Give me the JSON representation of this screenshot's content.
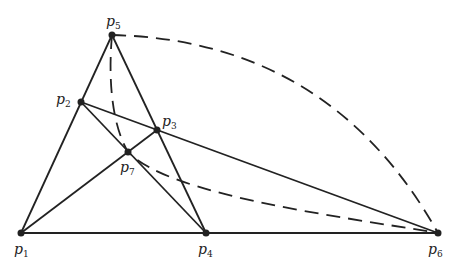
{
  "diagram": {
    "title": "",
    "colors": {
      "stroke": "#222222",
      "background": "#ffffff"
    },
    "points": [
      {
        "id": "p1",
        "label": "p",
        "sub": "1",
        "x": 21,
        "y": 233,
        "lx": 14,
        "ly": 242
      },
      {
        "id": "p2",
        "label": "p",
        "sub": "2",
        "x": 81,
        "y": 102,
        "lx": 56,
        "ly": 92
      },
      {
        "id": "p3",
        "label": "p",
        "sub": "3",
        "x": 157,
        "y": 130,
        "lx": 162,
        "ly": 114
      },
      {
        "id": "p4",
        "label": "p",
        "sub": "4",
        "x": 206,
        "y": 233,
        "lx": 198,
        "ly": 242
      },
      {
        "id": "p5",
        "label": "p",
        "sub": "5",
        "x": 112,
        "y": 35,
        "lx": 106,
        "ly": 14
      },
      {
        "id": "p6",
        "label": "p",
        "sub": "6",
        "x": 438,
        "y": 233,
        "lx": 428,
        "ly": 242
      },
      {
        "id": "p7",
        "label": "p",
        "sub": "7",
        "x": 128,
        "y": 152,
        "lx": 120,
        "ly": 160
      }
    ],
    "solid_lines": [
      [
        "p1",
        "p5"
      ],
      [
        "p5",
        "p4"
      ],
      [
        "p1",
        "p6"
      ],
      [
        "p2",
        "p6"
      ],
      [
        "p2",
        "p4"
      ],
      [
        "p1",
        "p3"
      ]
    ],
    "dashed_curves": [
      {
        "from": "p5",
        "to": "p6",
        "ctrl": [
          330,
          40
        ]
      },
      {
        "from": "p5",
        "to": "p6",
        "via": "p7",
        "ctrl1": [
          120,
          120
        ],
        "ctrl2": [
          200,
          200
        ]
      }
    ]
  }
}
